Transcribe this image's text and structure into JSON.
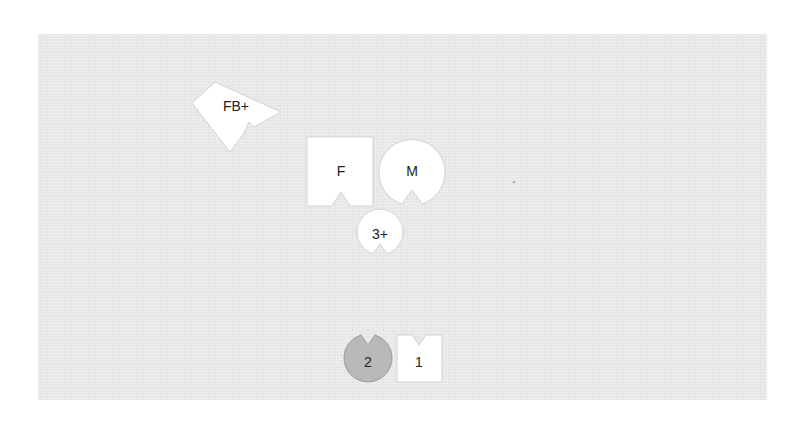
{
  "colors": {
    "background": "#ffffff",
    "panel": "#e9e9e9",
    "piece_fill": "#ffffff",
    "piece_stroke": "#cfcfcf",
    "selected_fill": "#b9b9b9",
    "selected_stroke": "#9a9a9a",
    "text": "#222222"
  },
  "pieces": [
    {
      "id": "fb-plus",
      "label": "FB+",
      "shape": "square",
      "notch": "rotated-side",
      "rotation_deg": -40,
      "selected": false
    },
    {
      "id": "f",
      "label": "F",
      "shape": "square",
      "notch": "bottom",
      "selected": false
    },
    {
      "id": "m",
      "label": "M",
      "shape": "circle",
      "notch": "bottom",
      "selected": false
    },
    {
      "id": "three-plus",
      "label": "3+",
      "shape": "circle",
      "notch": "bottom",
      "selected": false
    },
    {
      "id": "two",
      "label": "2",
      "shape": "circle",
      "notch": "top",
      "selected": true
    },
    {
      "id": "one",
      "label": "1",
      "shape": "square",
      "notch": "top",
      "selected": false
    }
  ]
}
